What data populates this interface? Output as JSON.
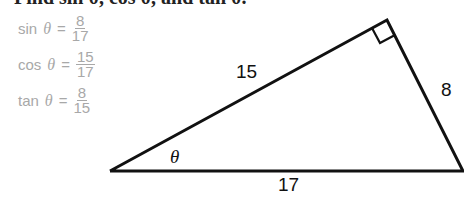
{
  "heading": "Find sin θ, cos θ, and tan θ.",
  "formulas": [
    {
      "fn": "sin",
      "var": "θ",
      "eq": "=",
      "num": "8",
      "den": "17"
    },
    {
      "fn": "cos",
      "var": "θ",
      "eq": "=",
      "num": "15",
      "den": "17"
    },
    {
      "fn": "tan",
      "var": "θ",
      "eq": "=",
      "num": "8",
      "den": "15"
    }
  ],
  "triangle": {
    "side_hyp": "17",
    "side_adj": "15",
    "side_opp": "8",
    "angle": "θ",
    "right_angle_marker": true
  },
  "colors": {
    "formula_text": "#a8a8a8",
    "lines": "#111111"
  }
}
